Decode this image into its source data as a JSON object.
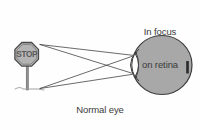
{
  "figure": {
    "background_color": "#fefefe",
    "labels": {
      "focus_line1": "In focus",
      "focus_line2": "on retina",
      "focus_full": "In focus\non retina",
      "caption": "Normal eye"
    },
    "object": {
      "name": "stop-sign",
      "sign_text": "STOP",
      "shape": "octagon",
      "fill_color": "#b0b0b0",
      "outline_color": "#4a4a4a",
      "post_color": "#8a8a8a"
    },
    "eye": {
      "name": "eyeball",
      "fill_color": "#a8a8a8",
      "outline_color": "#3d3d3d",
      "lens_fill": "#ffffff",
      "cornea_fill": "#f2f2f2",
      "retina_image_color": "#2b2b2b",
      "center_x": 162,
      "center_y": 65,
      "radius_x": 30,
      "radius_y": 30
    },
    "rays": {
      "name": "light-rays",
      "color": "#3a3a3a",
      "count": 4,
      "description": "Rays from top and bottom of the object cross at the lens and converge on the retina"
    }
  }
}
